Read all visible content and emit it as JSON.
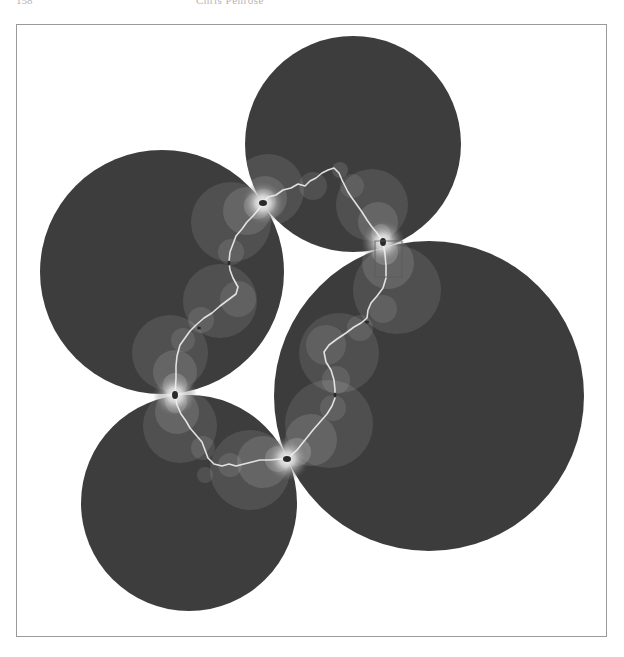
{
  "page": {
    "running_head": {
      "page_number": "158",
      "title": "Chris Penrose"
    }
  },
  "figure": {
    "colors": {
      "disk_fill": "#3d3d3d",
      "halo_fill": "#ffffff",
      "curve": "#f2f2f2",
      "frame": "#9a9a9a",
      "background": "#ffffff"
    },
    "disks": [
      {
        "name": "top",
        "cx": 353,
        "cy": 144,
        "r": 108
      },
      {
        "name": "left",
        "cx": 162,
        "cy": 272,
        "r": 122
      },
      {
        "name": "right",
        "cx": 429,
        "cy": 396,
        "r": 155
      },
      {
        "name": "bottom",
        "cx": 189,
        "cy": 503,
        "r": 108
      }
    ],
    "tangent_points": [
      {
        "x": 263,
        "y": 203
      },
      {
        "x": 383,
        "y": 242
      },
      {
        "x": 175,
        "y": 395
      },
      {
        "x": 287,
        "y": 459
      }
    ],
    "highlight_box": {
      "x": 375,
      "y": 241,
      "width": 27,
      "height": 36
    }
  }
}
